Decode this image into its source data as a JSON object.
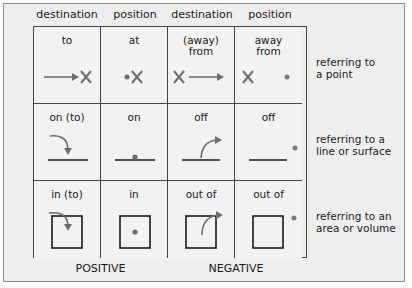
{
  "column_headers": [
    "destination",
    "position",
    "destination",
    "position"
  ],
  "rows": [
    {
      "label": "referring to a point",
      "label_lines": [
        "referring to",
        "a point"
      ],
      "cells": [
        {
          "text": "to",
          "icon": "arrow-to-x-icon"
        },
        {
          "text": "at",
          "icon": "dot-at-x-icon"
        },
        {
          "text_lines": [
            "(away)",
            "from"
          ],
          "icon": "x-arrow-away-icon"
        },
        {
          "text_lines": [
            "away",
            "from"
          ],
          "icon": "x-dot-apart-icon"
        }
      ]
    },
    {
      "label": "referring to a line or surface",
      "label_lines": [
        "referring to a",
        "line or surface"
      ],
      "cells": [
        {
          "text": "on (to)",
          "icon": "curved-arrow-onto-line-icon"
        },
        {
          "text": "on",
          "icon": "dot-on-line-icon"
        },
        {
          "text": "off",
          "icon": "curved-arrow-off-line-icon"
        },
        {
          "text": "off",
          "icon": "dot-off-line-icon"
        }
      ]
    },
    {
      "label": "referring to an area or volume",
      "label_lines": [
        "referring to an",
        "area or volume"
      ],
      "cells": [
        {
          "text": "in (to)",
          "icon": "curved-arrow-into-box-icon"
        },
        {
          "text": "in",
          "icon": "dot-in-box-icon"
        },
        {
          "text": "out of",
          "icon": "curved-arrow-out-of-box-icon"
        },
        {
          "text": "out of",
          "icon": "dot-outside-box-icon"
        }
      ]
    }
  ],
  "footer": {
    "positive": "POSITIVE",
    "negative": "NEGATIVE"
  },
  "colors": {
    "background": "#eeeeee",
    "line": "#1a1a1a",
    "arrow": "#6e6e6e",
    "dot": "#7a7a7a",
    "border": "#8a8a8a"
  }
}
